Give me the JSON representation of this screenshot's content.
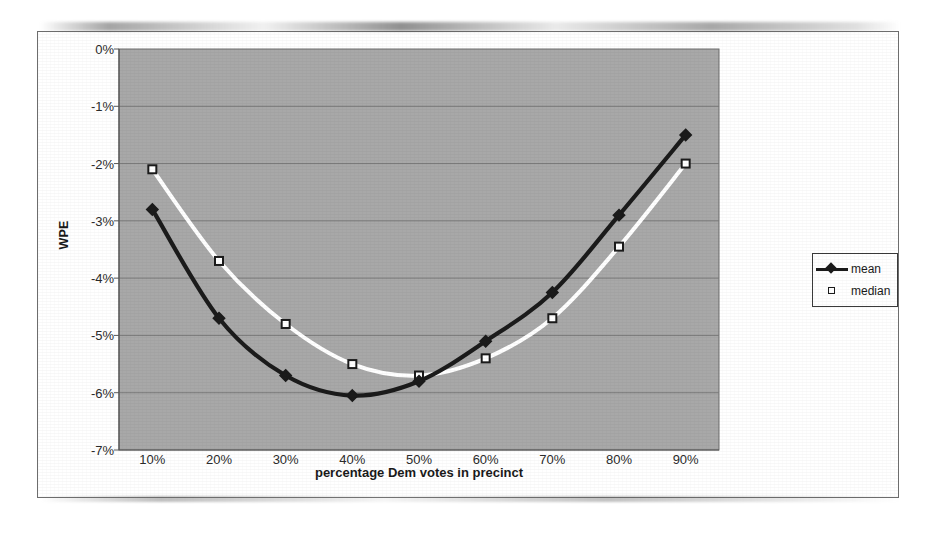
{
  "chart_data": {
    "type": "line",
    "title": "",
    "xlabel": "percentage Dem votes in precinct",
    "ylabel": "WPE",
    "categories": [
      "10%",
      "20%",
      "30%",
      "40%",
      "50%",
      "60%",
      "70%",
      "80%",
      "90%"
    ],
    "x": [
      10,
      20,
      30,
      40,
      50,
      60,
      70,
      80,
      90
    ],
    "xlim": [
      5,
      95
    ],
    "ylim": [
      -7,
      0
    ],
    "y_tick_labels": [
      "0%",
      "-1%",
      "-2%",
      "-3%",
      "-4%",
      "-5%",
      "-6%",
      "-7%"
    ],
    "y_ticks": [
      0,
      -1,
      -2,
      -3,
      -4,
      -5,
      -6,
      -7
    ],
    "grid": "horizontal",
    "legend_position": "right",
    "plot_background": "#a8a8a8",
    "series": [
      {
        "name": "mean",
        "color": "#1b1b1b",
        "marker": "diamond",
        "values": [
          -2.8,
          -4.7,
          -5.7,
          -6.05,
          -5.8,
          -5.1,
          -4.25,
          -2.9,
          -1.5
        ]
      },
      {
        "name": "median",
        "color": "#ffffff",
        "marker": "open-square",
        "values": [
          -2.1,
          -3.7,
          -4.8,
          -5.5,
          -5.7,
          -5.4,
          -4.7,
          -3.45,
          -2.0
        ]
      }
    ]
  },
  "legend": {
    "items": [
      {
        "label": "mean"
      },
      {
        "label": "median"
      }
    ]
  }
}
